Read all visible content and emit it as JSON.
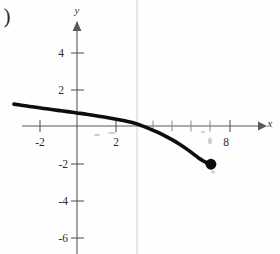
{
  "figure": {
    "label": ")",
    "background_color": "#fefefe",
    "curve_color": "#0d0d0d",
    "axis_color": "#595959",
    "fold_line_color": "#d2d2d2"
  },
  "chart_data": {
    "type": "line",
    "title": "",
    "xlabel": "x",
    "ylabel": "y",
    "xlim": [
      -3.9,
      9.7
    ],
    "ylim": [
      -6.9,
      5.6
    ],
    "grid": false,
    "legend": null,
    "x_ticks": [
      -2,
      2,
      8
    ],
    "x_tick_labels": [
      "-2",
      "2",
      "8"
    ],
    "x_minor_ticks": [
      4,
      5,
      6,
      7
    ],
    "y_ticks": [
      4,
      2,
      -2,
      -4,
      -6
    ],
    "y_tick_labels": [
      "4",
      "2",
      "-2",
      "-4",
      "-6"
    ],
    "series": [
      {
        "name": "curve",
        "x": [
          -3.32,
          -3.0,
          -2.5,
          -2.0,
          -1.5,
          -1.0,
          -0.5,
          0.0,
          0.5,
          1.0,
          1.5,
          2.0,
          2.5,
          3.0,
          3.4,
          3.8,
          4.2,
          4.6,
          5.0,
          5.4,
          5.8,
          6.1,
          6.4,
          6.65,
          6.85,
          7.0,
          7.05
        ],
        "y": [
          1.19,
          1.14,
          1.06,
          0.99,
          0.92,
          0.85,
          0.78,
          0.71,
          0.64,
          0.56,
          0.47,
          0.38,
          0.28,
          0.16,
          0.02,
          -0.14,
          -0.32,
          -0.52,
          -0.74,
          -0.99,
          -1.27,
          -1.5,
          -1.74,
          -1.9,
          -2.0,
          -2.06,
          -2.08
        ]
      }
    ],
    "endpoint": {
      "x": 7.05,
      "y": -2.08,
      "filled": true,
      "label": ""
    },
    "annotations": []
  },
  "axes": {
    "x_axis_label": "x",
    "y_axis_label": "y",
    "origin_px": {
      "x": 77,
      "y": 126
    },
    "unit_px": {
      "x": 19.0,
      "y": 18.4
    }
  }
}
